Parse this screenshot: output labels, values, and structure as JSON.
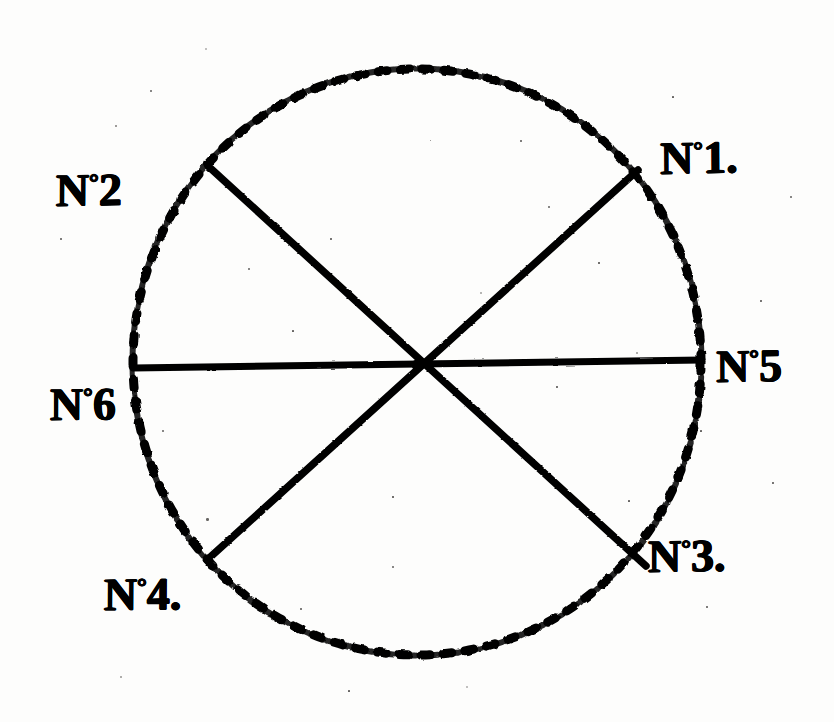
{
  "figure": {
    "background_color": "#fdfdfc",
    "ink_color": "#000000"
  },
  "geometry": {
    "center": {
      "x": 417,
      "y": 362
    },
    "radius_x": 284,
    "radius_y": 293,
    "sector_count": 6,
    "circle_style": "dotted",
    "diameters": [
      {
        "name": "horizontal-diameter",
        "x1": 133,
        "y1": 368,
        "x2": 702,
        "y2": 360
      },
      {
        "name": "diagonal-nw-se",
        "x1": 208,
        "y1": 166,
        "x2": 646,
        "y2": 566
      },
      {
        "name": "diagonal-ne-sw",
        "x1": 638,
        "y1": 170,
        "x2": 207,
        "y2": 560
      }
    ]
  },
  "labels": [
    {
      "id": "no1",
      "prefix": "N",
      "ordinal": "°",
      "number": "1",
      "suffix": ".",
      "text": "N°1.",
      "position": "upper-right",
      "angle_deg": 30
    },
    {
      "id": "no2",
      "prefix": "N",
      "ordinal": "°",
      "number": "2",
      "suffix": "",
      "text": "N°2",
      "position": "upper-left",
      "angle_deg": 150
    },
    {
      "id": "no3",
      "prefix": "N",
      "ordinal": "°",
      "number": "3",
      "suffix": ".",
      "text": "N°3.",
      "position": "lower-right",
      "angle_deg": 330
    },
    {
      "id": "no4",
      "prefix": "N",
      "ordinal": "°",
      "number": "4",
      "suffix": ".",
      "text": "N°4.",
      "position": "lower-left",
      "angle_deg": 210
    },
    {
      "id": "no5",
      "prefix": "N",
      "ordinal": "°",
      "number": "5",
      "suffix": "",
      "text": "N°5",
      "position": "right",
      "angle_deg": 0
    },
    {
      "id": "no6",
      "prefix": "N",
      "ordinal": "°",
      "number": "6",
      "suffix": "",
      "text": "N°6",
      "position": "left",
      "angle_deg": 180
    }
  ]
}
